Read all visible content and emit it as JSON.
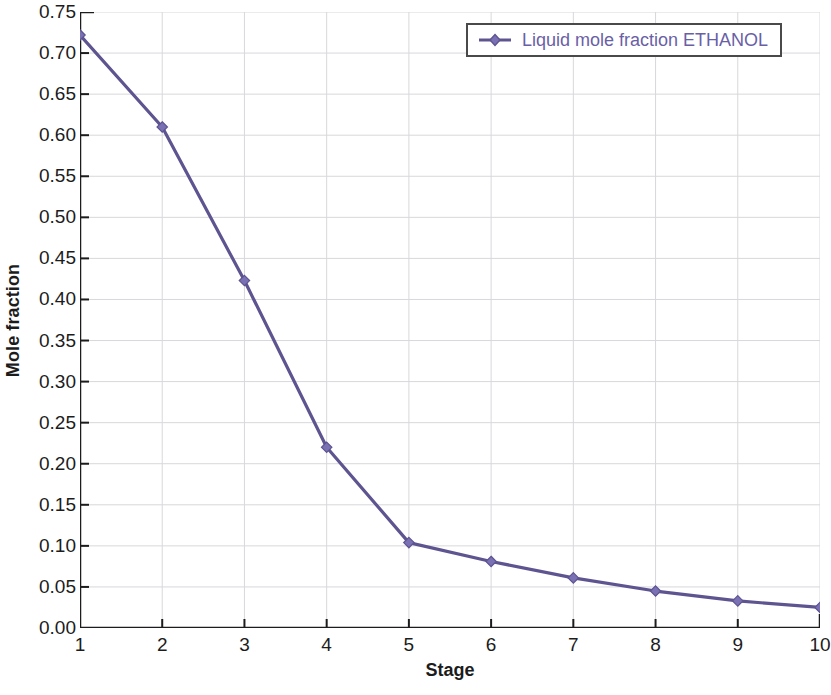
{
  "chart_data": {
    "type": "line",
    "title": "",
    "xlabel": "Stage",
    "ylabel": "Mole fraction",
    "x": [
      1,
      2,
      3,
      4,
      5,
      6,
      7,
      8,
      9,
      10
    ],
    "xlim": [
      1,
      10
    ],
    "ylim": [
      0.0,
      0.75
    ],
    "xticks": [
      "1",
      "2",
      "3",
      "4",
      "5",
      "6",
      "7",
      "8",
      "9",
      "10"
    ],
    "yticks": [
      "0.00",
      "0.05",
      "0.10",
      "0.15",
      "0.20",
      "0.25",
      "0.30",
      "0.35",
      "0.40",
      "0.45",
      "0.50",
      "0.55",
      "0.60",
      "0.65",
      "0.70",
      "0.75"
    ],
    "ytick_values": [
      0.0,
      0.05,
      0.1,
      0.15,
      0.2,
      0.25,
      0.3,
      0.35,
      0.4,
      0.45,
      0.5,
      0.55,
      0.6,
      0.65,
      0.7,
      0.75
    ],
    "grid": true,
    "legend_position": "top-right",
    "series": [
      {
        "name": "Liquid mole fraction ETHANOL",
        "color": "#6a5fa6",
        "marker": "diamond",
        "values": [
          0.722,
          0.61,
          0.423,
          0.22,
          0.104,
          0.081,
          0.061,
          0.045,
          0.033,
          0.025
        ]
      }
    ]
  },
  "axes": {
    "y_title": "Mole fraction",
    "x_title": "Stage"
  },
  "legend": {
    "entries": [
      {
        "label": "Liquid mole fraction ETHANOL",
        "color": "#6a5fa6",
        "marker_icon": "diamond-marker-icon"
      }
    ]
  },
  "colors": {
    "series_line": "#5d5490",
    "series_marker": "#7a70b4",
    "legend_text": "#6a5fa6",
    "legend_border": "#4a4a4a",
    "axis": "#1c1c1c",
    "grid": "#d8d8dc",
    "background": "#ffffff"
  }
}
